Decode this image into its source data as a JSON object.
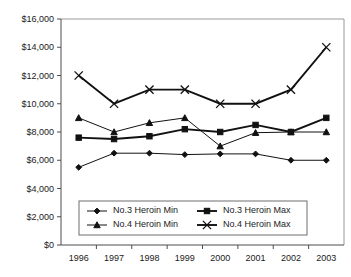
{
  "chart_data": {
    "type": "line",
    "title": "",
    "xlabel": "",
    "ylabel": "",
    "categories": [
      "1996",
      "1997",
      "1998",
      "1999",
      "2000",
      "2001",
      "2002",
      "2003"
    ],
    "ylim": [
      0,
      16000
    ],
    "ytick_values": [
      0,
      2000,
      4000,
      6000,
      8000,
      10000,
      12000,
      14000,
      16000
    ],
    "ytick_labels": [
      "$0",
      "$2,000",
      "$4,000",
      "$6,000",
      "$8,000",
      "$10,000",
      "$12,000",
      "$14,000",
      "$16,000"
    ],
    "grid": false,
    "legend_position": "inside-bottom-center",
    "series": [
      {
        "name": "No.3 Heroin Min",
        "marker": "diamond",
        "line_weight": "thin",
        "values": [
          5500,
          6500,
          6500,
          6400,
          6450,
          6450,
          6000,
          6000
        ]
      },
      {
        "name": "No.3 Heroin Max",
        "marker": "square",
        "line_weight": "thick",
        "values": [
          7600,
          7500,
          7700,
          8200,
          8000,
          8500,
          8000,
          9000
        ]
      },
      {
        "name": "No.4 Heroin Min",
        "marker": "triangle",
        "line_weight": "thin",
        "values": [
          9000,
          8000,
          8650,
          9000,
          7000,
          7950,
          8000,
          8000
        ]
      },
      {
        "name": "No.4 Heroin Max",
        "marker": "cross",
        "line_weight": "thick",
        "values": [
          12000,
          10000,
          11000,
          11000,
          10000,
          10000,
          11000,
          14000
        ]
      }
    ]
  },
  "legend": {
    "entries": [
      {
        "label": "No.3 Heroin Min"
      },
      {
        "label": "No.3 Heroin Max"
      },
      {
        "label": "No.4 Heroin Min"
      },
      {
        "label": "No.4 Heroin Max"
      }
    ]
  },
  "colors": {
    "series": "#111111",
    "axis": "#4d4d4d",
    "frame": "#9a9a9a",
    "background": "#ffffff"
  }
}
